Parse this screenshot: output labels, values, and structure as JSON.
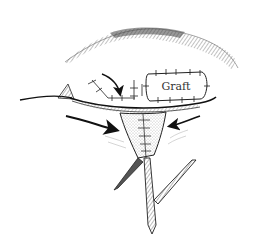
{
  "figure": {
    "type": "surgical-illustration",
    "colors": {
      "ink": "#222222",
      "background": "#ffffff",
      "shade": "#888888"
    },
    "labels": {
      "graft": "Graft"
    },
    "elements": [
      "eyebrow",
      "upper-eyelid",
      "graft-patch",
      "sutures",
      "advancement-arrows",
      "wedge-closure",
      "z-plasty-limbs"
    ]
  }
}
